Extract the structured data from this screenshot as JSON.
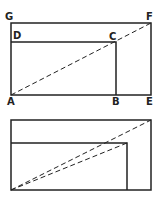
{
  "figure_top": {
    "labels": {
      "G": "G",
      "F": "F",
      "D": "D",
      "C": "C",
      "A": "A",
      "B": "B",
      "E": "E"
    }
  },
  "figure_bottom": {
    "labels": {}
  },
  "colors": {
    "line": "#222222",
    "background": "#ffffff"
  }
}
